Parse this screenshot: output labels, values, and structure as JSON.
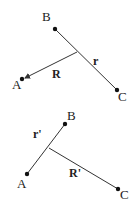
{
  "diagrams": [
    {
      "name": "top",
      "points": {
        "A": {
          "label": "A",
          "x": 22,
          "y": 79,
          "lx": 12,
          "ly": 89
        },
        "B": {
          "label": "B",
          "x": 55,
          "y": 29,
          "lx": 42,
          "ly": 21
        },
        "C": {
          "label": "C",
          "x": 117,
          "y": 90,
          "lx": 118,
          "ly": 101
        }
      },
      "junction": {
        "x": 77,
        "y": 52
      },
      "vector_labels": {
        "R": {
          "text": "R",
          "x": 52,
          "y": 78
        },
        "r": {
          "text": "r",
          "x": 93,
          "y": 65
        }
      }
    },
    {
      "name": "bottom",
      "points": {
        "A": {
          "label": "A",
          "x": 27,
          "y": 174,
          "lx": 17,
          "ly": 188
        },
        "B": {
          "label": "B",
          "x": 65,
          "y": 124,
          "lx": 67,
          "ly": 120
        },
        "C": {
          "label": "C",
          "x": 118,
          "y": 189,
          "lx": 120,
          "ly": 199
        }
      },
      "junction": {
        "x": 49,
        "y": 148
      },
      "vector_labels": {
        "r_prime": {
          "text": "r'",
          "x": 33,
          "y": 138
        },
        "R_prime": {
          "text": "R'",
          "x": 69,
          "y": 177
        }
      }
    }
  ],
  "colors": {
    "line": "#333333",
    "dot": "#111111"
  }
}
